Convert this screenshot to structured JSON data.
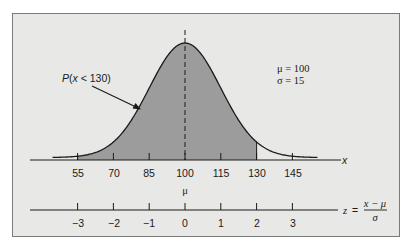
{
  "chart_data": {
    "type": "area",
    "title": "",
    "distribution": "normal",
    "params": {
      "mu": 100,
      "sigma": 15
    },
    "shaded_region": {
      "from": 55,
      "to": 130,
      "label": "P(x < 130)"
    },
    "x_axis": {
      "label": "x",
      "ticks": [
        55,
        70,
        85,
        100,
        115,
        130,
        145
      ],
      "tick_labels": [
        "55",
        "70",
        "85",
        "100",
        "115",
        "130",
        "145"
      ],
      "mean_marker": "μ"
    },
    "z_axis": {
      "label": "z = (x − μ) / σ",
      "ticks": [
        -3,
        -2,
        -1,
        0,
        1,
        2,
        3
      ],
      "tick_labels": [
        "−3",
        "−2",
        "−1",
        "0",
        "1",
        "2",
        "3"
      ]
    },
    "annotations": [
      "μ = 100",
      "σ = 15",
      "P(x < 130)"
    ],
    "grid": false,
    "colors": {
      "shade": "#9a9a9a",
      "background": "#e8e8e6",
      "curve": "#1a1a1a"
    }
  },
  "labels": {
    "prob": "P(x < 130)",
    "prob_P": "P",
    "prob_open": "(",
    "prob_x": "x",
    "prob_rest": " < 130)",
    "mu_param": "μ = 100",
    "sigma_param": "σ = 15",
    "x_axis_label": "x",
    "mu_marker": "μ",
    "z_lhs": "z",
    "z_eq": "=",
    "z_num": "x − μ",
    "z_den": "σ"
  },
  "x_ticks": [
    "55",
    "70",
    "85",
    "100",
    "115",
    "130",
    "145"
  ],
  "z_ticks": [
    "−3",
    "−2",
    "−1",
    "0",
    "1",
    "2",
    "3"
  ]
}
